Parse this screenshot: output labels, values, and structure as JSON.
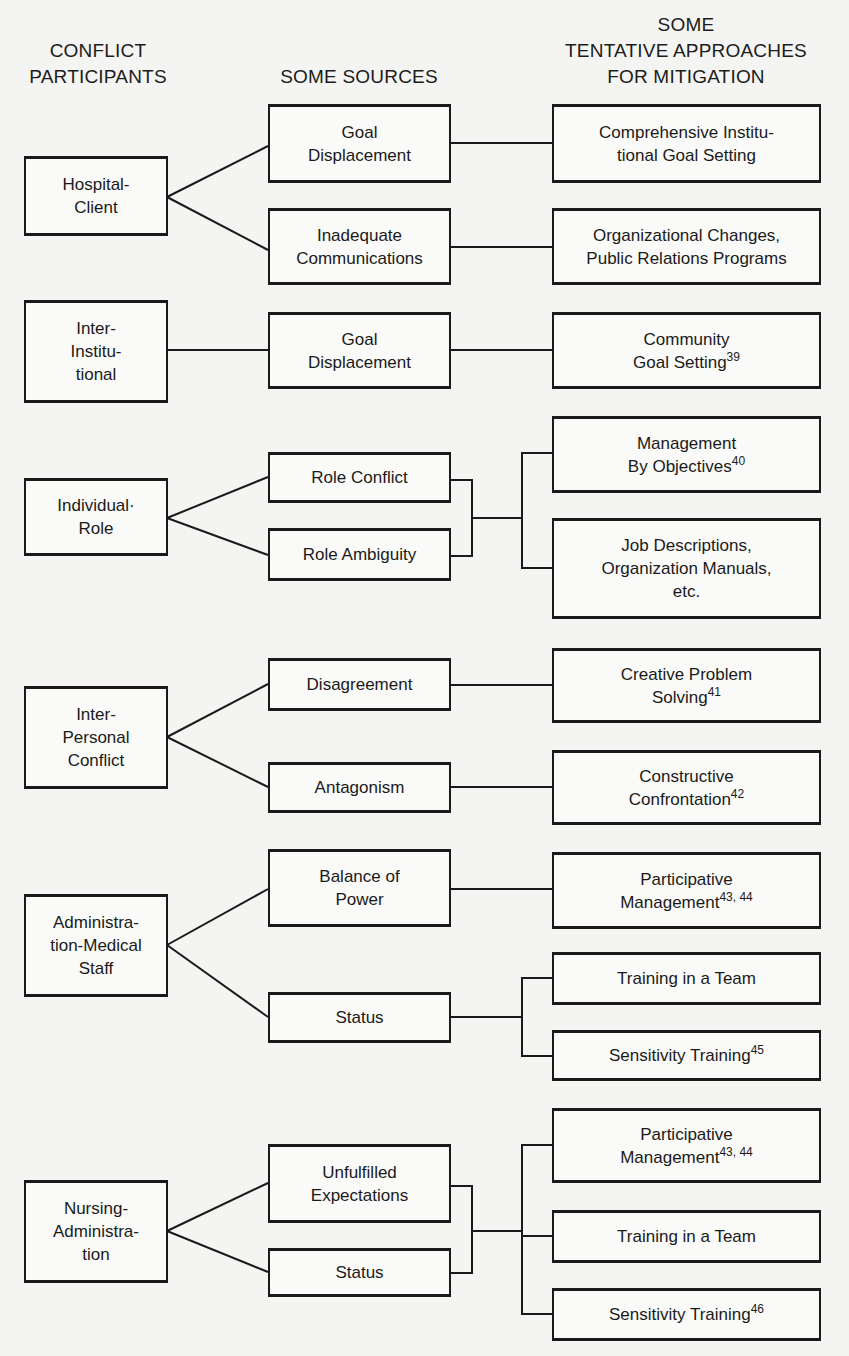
{
  "headers": {
    "participants": "CONFLICT\nPARTICIPANTS",
    "sources": "SOME SOURCES",
    "approaches": "SOME\nTENTATIVE APPROACHES\nFOR MITIGATION"
  },
  "participants": [
    {
      "label": "Hospital-\nClient"
    },
    {
      "label": "Inter-\nInstitu-\ntional"
    },
    {
      "label": "Individual·\nRole"
    },
    {
      "label": "Inter-\nPersonal\nConflict"
    },
    {
      "label": "Administra-\ntion-Medical\nStaff"
    },
    {
      "label": "Nursing-\nAdministra-\ntion"
    }
  ],
  "sources": [
    {
      "label": "Goal\nDisplacement"
    },
    {
      "label": "Inadequate\nCommunications"
    },
    {
      "label": "Goal\nDisplacement"
    },
    {
      "label": "Role Conflict"
    },
    {
      "label": "Role Ambiguity"
    },
    {
      "label": "Disagreement"
    },
    {
      "label": "Antagonism"
    },
    {
      "label": "Balance of\nPower"
    },
    {
      "label": "Status"
    },
    {
      "label": "Unfulfilled\nExpectations"
    },
    {
      "label": "Status"
    }
  ],
  "approaches": [
    {
      "label": "Comprehensive Institu-\ntional Goal Setting",
      "ref": ""
    },
    {
      "label": "Organizational Changes,\nPublic Relations Programs",
      "ref": ""
    },
    {
      "label": "Community\nGoal Setting",
      "ref": "39"
    },
    {
      "label": "Management\nBy Objectives",
      "ref": "40"
    },
    {
      "label": "Job Descriptions,\nOrganization Manuals,\netc.",
      "ref": ""
    },
    {
      "label": "Creative Problem\nSolving",
      "ref": "41"
    },
    {
      "label": "Constructive\nConfrontation",
      "ref": "42"
    },
    {
      "label": "Participative\nManagement",
      "ref": "43, 44"
    },
    {
      "label": "Training in a Team",
      "ref": ""
    },
    {
      "label": "Sensitivity Training",
      "ref": "45"
    },
    {
      "label": "Participative\nManagement",
      "ref": "43, 44"
    },
    {
      "label": "Training in a Team",
      "ref": ""
    },
    {
      "label": "Sensitivity Training",
      "ref": "46"
    }
  ]
}
